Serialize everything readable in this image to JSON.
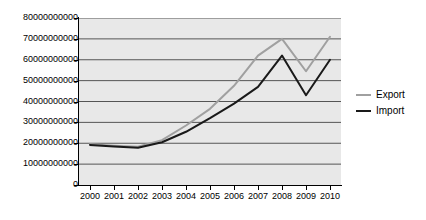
{
  "chart_data": {
    "type": "line",
    "title": "",
    "xlabel": "",
    "ylabel": "",
    "categories": [
      "2000",
      "2001",
      "2002",
      "2003",
      "2004",
      "2005",
      "2006",
      "2007",
      "2008",
      "2009",
      "2010"
    ],
    "ylim": [
      0,
      80000000000
    ],
    "yticks": [
      0,
      10000000000,
      20000000000,
      30000000000,
      40000000000,
      50000000000,
      60000000000,
      70000000000,
      80000000000
    ],
    "ytick_labels": [
      "0",
      "10000000000",
      "20000000000",
      "30000000000",
      "40000000000",
      "50000000000",
      "60000000000",
      "70000000000",
      "80000000000"
    ],
    "grid": true,
    "legend_position": "right",
    "series": [
      {
        "name": "Export",
        "color": "#a0a0a0",
        "values": [
          19500000000,
          18800000000,
          18300000000,
          21500000000,
          28500000000,
          36500000000,
          47500000000,
          62000000000,
          70000000000,
          54500000000,
          71000000000
        ]
      },
      {
        "name": "Import",
        "color": "#1a1a1a",
        "values": [
          19200000000,
          18500000000,
          17800000000,
          20500000000,
          25500000000,
          32000000000,
          39000000000,
          47000000000,
          62000000000,
          43000000000,
          60000000000
        ]
      }
    ]
  },
  "legend": {
    "items": [
      {
        "label": "Export",
        "swatch_name": "legend-swatch-export"
      },
      {
        "label": "Import",
        "swatch_name": "legend-swatch-import"
      }
    ]
  },
  "colors": {
    "plot_background": "#e8e8e8",
    "gridline": "#555555",
    "axis": "#000000",
    "export_line": "#a0a0a0",
    "import_line": "#1a1a1a"
  }
}
